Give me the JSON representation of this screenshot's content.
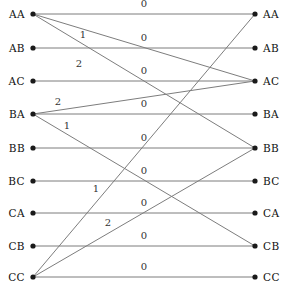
{
  "diagram": {
    "type": "bipartite-graph",
    "node_count_per_side": 9,
    "left_nodes": [
      {
        "id": "L-AA",
        "label": "AA",
        "x": 33,
        "y": 14
      },
      {
        "id": "L-AB",
        "label": "AB",
        "x": 33,
        "y": 48
      },
      {
        "id": "L-AC",
        "label": "AC",
        "x": 33,
        "y": 81
      },
      {
        "id": "L-BA",
        "label": "BA",
        "x": 33,
        "y": 114
      },
      {
        "id": "L-BB",
        "label": "BB",
        "x": 33,
        "y": 148
      },
      {
        "id": "L-BC",
        "label": "BC",
        "x": 33,
        "y": 181
      },
      {
        "id": "L-CA",
        "label": "CA",
        "x": 33,
        "y": 213
      },
      {
        "id": "L-CB",
        "label": "CB",
        "x": 33,
        "y": 246
      },
      {
        "id": "L-CC",
        "label": "CC",
        "x": 33,
        "y": 277
      }
    ],
    "right_nodes": [
      {
        "id": "R-AA",
        "label": "AA",
        "x": 255,
        "y": 14
      },
      {
        "id": "R-AB",
        "label": "AB",
        "x": 255,
        "y": 48
      },
      {
        "id": "R-AC",
        "label": "AC",
        "x": 255,
        "y": 81
      },
      {
        "id": "R-BA",
        "label": "BA",
        "x": 255,
        "y": 114
      },
      {
        "id": "R-BB",
        "label": "BB",
        "x": 255,
        "y": 148
      },
      {
        "id": "R-BC",
        "label": "BC",
        "x": 255,
        "y": 181
      },
      {
        "id": "R-CA",
        "label": "CA",
        "x": 255,
        "y": 213
      },
      {
        "id": "R-CB",
        "label": "CB",
        "x": 255,
        "y": 246
      },
      {
        "id": "R-CC",
        "label": "CC",
        "x": 255,
        "y": 277
      }
    ],
    "edges": [
      {
        "from": "L-AA",
        "to": "R-AA",
        "label": "0",
        "lx": 144,
        "ly": 7
      },
      {
        "from": "L-AB",
        "to": "R-AB",
        "label": "0",
        "lx": 144,
        "ly": 41
      },
      {
        "from": "L-AC",
        "to": "R-AC",
        "label": "0",
        "lx": 144,
        "ly": 74
      },
      {
        "from": "L-BA",
        "to": "R-BA",
        "label": "0",
        "lx": 144,
        "ly": 107
      },
      {
        "from": "L-BB",
        "to": "R-BB",
        "label": "0",
        "lx": 144,
        "ly": 141
      },
      {
        "from": "L-BC",
        "to": "R-BC",
        "label": "0",
        "lx": 144,
        "ly": 174
      },
      {
        "from": "L-CA",
        "to": "R-CA",
        "label": "0",
        "lx": 144,
        "ly": 206
      },
      {
        "from": "L-CB",
        "to": "R-CB",
        "label": "0",
        "lx": 144,
        "ly": 239
      },
      {
        "from": "L-CC",
        "to": "R-CC",
        "label": "0",
        "lx": 144,
        "ly": 270
      },
      {
        "from": "L-AA",
        "to": "R-AC",
        "label": "1",
        "lx": 83,
        "ly": 38
      },
      {
        "from": "L-AA",
        "to": "R-BB",
        "label": "2",
        "lx": 79,
        "ly": 67
      },
      {
        "from": "L-BA",
        "to": "R-AC",
        "label": "2",
        "lx": 58,
        "ly": 105
      },
      {
        "from": "L-BA",
        "to": "R-CB",
        "label": "1",
        "lx": 67,
        "ly": 129
      },
      {
        "from": "L-CC",
        "to": "R-AA",
        "label": "1",
        "lx": 96,
        "ly": 192
      },
      {
        "from": "L-CC",
        "to": "R-BB",
        "label": "2",
        "lx": 108,
        "ly": 226
      }
    ],
    "edge_labels_legend": {
      "zero": "0",
      "one": "1",
      "two": "2"
    },
    "colors": {
      "edge": "#7d7d7d",
      "node": "#1a1a1a",
      "text": "#111111",
      "background": "#ffffff"
    }
  }
}
